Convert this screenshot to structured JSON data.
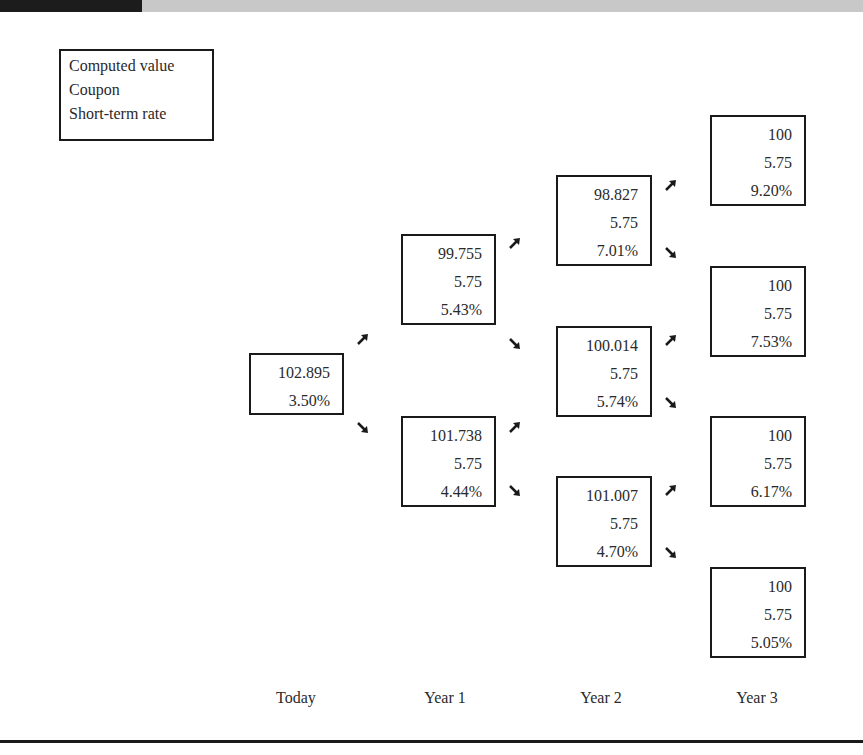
{
  "legend": {
    "lines": [
      "Computed value",
      "Coupon",
      "Short-term rate"
    ]
  },
  "tree": {
    "today": {
      "value": "102.895",
      "rate": "3.50%"
    },
    "year1": [
      {
        "value": "99.755",
        "coupon": "5.75",
        "rate": "5.43%"
      },
      {
        "value": "101.738",
        "coupon": "5.75",
        "rate": "4.44%"
      }
    ],
    "year2": [
      {
        "value": "98.827",
        "coupon": "5.75",
        "rate": "7.01%"
      },
      {
        "value": "100.014",
        "coupon": "5.75",
        "rate": "5.74%"
      },
      {
        "value": "101.007",
        "coupon": "5.75",
        "rate": "4.70%"
      }
    ],
    "year3": [
      {
        "value": "100",
        "coupon": "5.75",
        "rate": "9.20%"
      },
      {
        "value": "100",
        "coupon": "5.75",
        "rate": "7.53%"
      },
      {
        "value": "100",
        "coupon": "5.75",
        "rate": "6.17%"
      },
      {
        "value": "100",
        "coupon": "5.75",
        "rate": "5.05%"
      }
    ]
  },
  "periods": [
    "Today",
    "Year 1",
    "Year 2",
    "Year 3"
  ],
  "icons": {
    "up": "arrow-up-right-icon",
    "down": "arrow-down-right-icon"
  },
  "colors": {
    "border": "#1a1a1a",
    "text": "#2a2a2a",
    "header_bar": "#c8c8c8",
    "header_dark": "#1c1c1c"
  }
}
